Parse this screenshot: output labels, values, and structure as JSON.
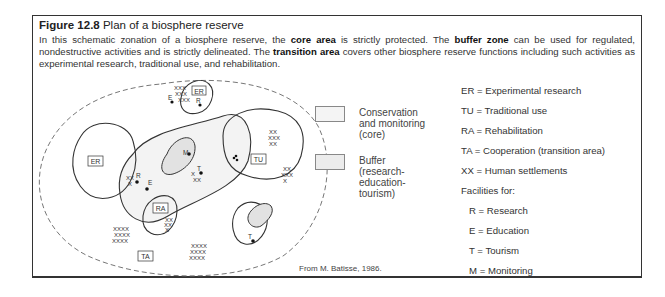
{
  "figure": {
    "number": "Figure 12.8",
    "title": "Plan of a biosphere reserve",
    "caption": {
      "part1": "In this schematic zonation of a biosphere reserve, the ",
      "core_term": "core area",
      "part2": " is strictly protected. The ",
      "buffer_term": "buffer zone",
      "part3": " can be used for regulated, nondestructive activities and is strictly delineated. The ",
      "transition_term": "transition area",
      "part4": " covers other biosphere reserve functions including such activities as experimental research, traditional use, and rehabilitation."
    },
    "source": "From M. Batisse, 1986."
  },
  "legend": {
    "swatches": [
      {
        "label": "Conservation\nand monitoring\n(core)",
        "color": "#f4f4f4"
      },
      {
        "label": "Buffer\n(research-\neducation-\ntourism)",
        "color": "#ececec"
      }
    ]
  },
  "key": {
    "zones": [
      "ER = Experimental research",
      "TU = Traditional use",
      "RA = Rehabilitation",
      "TA = Cooperation (transition area)",
      "XX = Human settlements"
    ],
    "facilities_heading": "Facilities for:",
    "facilities": [
      "R = Research",
      "E = Education",
      "T = Tourism",
      "M = Monitoring"
    ]
  },
  "diagram": {
    "zone_labels": {
      "er_top": "ER",
      "er_left": "ER",
      "tu": "TU",
      "ra": "RA",
      "ta": "TA"
    },
    "facility_labels": {
      "e_top": "E",
      "r_top": "R",
      "r_left": "R",
      "e_mid": "E",
      "m": "M",
      "t_mid": "T",
      "t_bottom": "T"
    },
    "settlement_mark": "X",
    "colors": {
      "line": "#333333",
      "core_fill": "#e2e2e2",
      "buffer_fill": "#f3f3f3",
      "transition_dash": "#777777"
    }
  }
}
